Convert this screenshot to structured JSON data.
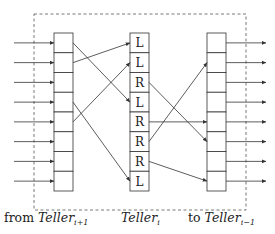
{
  "diagram": {
    "type": "routing-network",
    "boundary": {
      "style": "dashed"
    },
    "left_column": {
      "cells": 8,
      "label_prefix": "from ",
      "label_main": "Teller",
      "label_sub": "i+1"
    },
    "middle_column": {
      "cells": [
        "L",
        "L",
        "R",
        "L",
        "R",
        "R",
        "R",
        "L"
      ],
      "label_main": "Teller",
      "label_sub": "i"
    },
    "right_column": {
      "cells": 8,
      "label_prefix": "to ",
      "label_main": "Teller",
      "label_sub": "i−1"
    },
    "left_to_middle": [
      {
        "from": 0,
        "to": 3
      },
      {
        "from": 1,
        "to": 0
      },
      {
        "from": 3,
        "to": 7
      },
      {
        "from": 4,
        "to": 1
      }
    ],
    "middle_to_right": [
      {
        "from": 2,
        "to": 5
      },
      {
        "from": 4,
        "to": 4
      },
      {
        "from": 5,
        "to": 1
      },
      {
        "from": 6,
        "to": 7
      }
    ],
    "colors": {
      "stroke": "#333333",
      "dashed": "#555555",
      "text": "#222222"
    }
  }
}
